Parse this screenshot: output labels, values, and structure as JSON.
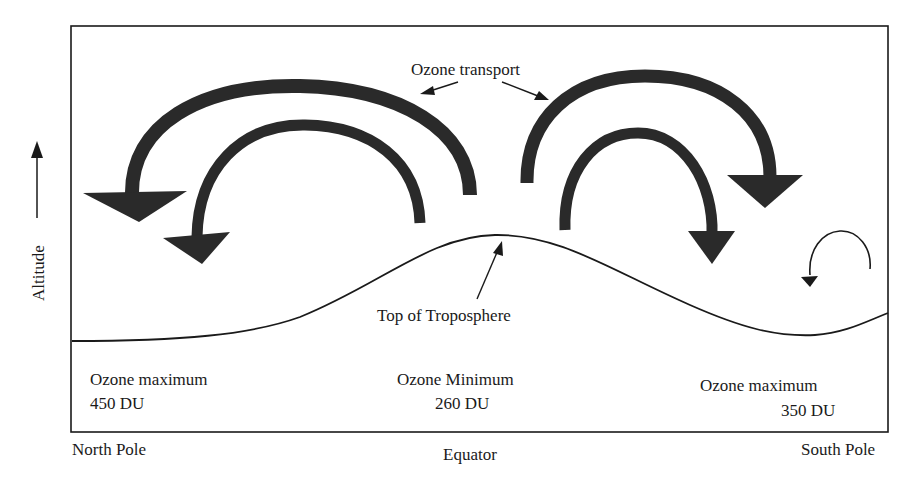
{
  "diagram": {
    "axis": {
      "y_label": "Altitude",
      "x_left": "North Pole",
      "x_center": "Equator",
      "x_right": "South Pole"
    },
    "annotations": {
      "transport": "Ozone transport",
      "tropopause": "Top  of Troposphere"
    },
    "regions": [
      {
        "title": "Ozone maximum",
        "value": "450 DU"
      },
      {
        "title": "Ozone Minimum",
        "value": "260 DU"
      },
      {
        "title": "Ozone maximum",
        "value": "350 DU"
      }
    ],
    "colors": {
      "arrow": "#2a2a2a",
      "line": "#1a1a1a",
      "background": "#ffffff"
    }
  }
}
